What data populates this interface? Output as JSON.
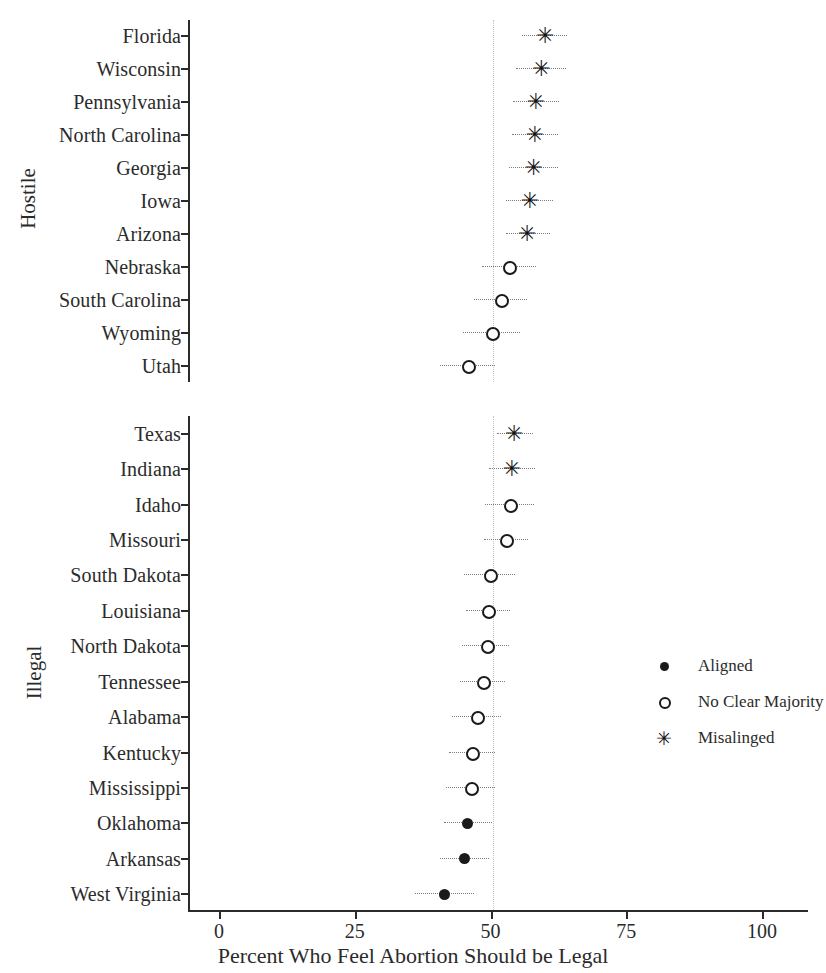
{
  "chart_data": {
    "type": "scatter",
    "title": "",
    "xlabel": "Percent Who Feel Abortion Should be Legal",
    "ylabel": "",
    "xlim": [
      0,
      100
    ],
    "xticks": [
      0,
      25,
      50,
      75,
      100
    ],
    "xtick_labels": [
      "0",
      "25",
      "50",
      "75",
      "100"
    ],
    "grid": false,
    "reference_line": 50,
    "legend_position": "right-middle",
    "orientation": "horizontal-dotplot",
    "error_bars": true,
    "panels": [
      {
        "name": "Hostile",
        "label": "Hostile",
        "categories": [
          "Florida",
          "Wisconsin",
          "Pennsylvania",
          "North Carolina",
          "Georgia",
          "Iowa",
          "Arizona",
          "Nebraska",
          "South Carolina",
          "Wyoming",
          "Utah"
        ],
        "values": [
          59.7,
          59.0,
          58.0,
          57.8,
          57.6,
          56.9,
          56.4,
          53.0,
          51.5,
          49.9,
          45.5
        ],
        "ci_low": [
          55.4,
          54.3,
          53.8,
          53.6,
          53.0,
          52.5,
          52.4,
          48.0,
          46.6,
          44.6,
          40.3
        ],
        "ci_high": [
          63.8,
          63.6,
          62.3,
          62.0,
          62.0,
          61.2,
          60.6,
          58.0,
          56.3,
          55.1,
          50.5
        ],
        "groups": [
          "Misalinged",
          "Misalinged",
          "Misalinged",
          "Misalinged",
          "Misalinged",
          "Misalinged",
          "Misalinged",
          "No Clear Majority",
          "No Clear Majority",
          "No Clear Majority",
          "No Clear Majority"
        ]
      },
      {
        "name": "Illegal",
        "label": "Illegal",
        "categories": [
          "Texas",
          "Indiana",
          "Idaho",
          "Missouri",
          "South Dakota",
          "Louisiana",
          "North Dakota",
          "Tennessee",
          "Alabama",
          "Kentucky",
          "Mississippi",
          "Oklahoma",
          "Arkansas",
          "West Virginia"
        ],
        "values": [
          54.0,
          53.6,
          53.2,
          52.5,
          49.5,
          49.1,
          48.9,
          48.2,
          47.1,
          46.2,
          46.0,
          45.4,
          44.9,
          41.1
        ],
        "ci_low": [
          50.8,
          49.4,
          48.7,
          48.4,
          44.7,
          45.1,
          44.4,
          44.1,
          42.5,
          41.9,
          41.4,
          41.0,
          40.3,
          35.8
        ],
        "ci_high": [
          57.4,
          57.9,
          57.6,
          56.5,
          54.2,
          53.2,
          53.1,
          52.3,
          51.6,
          50.4,
          50.5,
          50.0,
          49.4,
          46.6
        ],
        "groups": [
          "Misalinged",
          "Misalinged",
          "No Clear Majority",
          "No Clear Majority",
          "No Clear Majority",
          "No Clear Majority",
          "No Clear Majority",
          "No Clear Majority",
          "No Clear Majority",
          "No Clear Majority",
          "No Clear Majority",
          "Aligned",
          "Aligned",
          "Aligned"
        ]
      }
    ],
    "legend": [
      {
        "key": "aligned",
        "glyph": "filled-circle",
        "label": "Aligned"
      },
      {
        "key": "nomajority",
        "glyph": "open-circle",
        "label": "No Clear Majority"
      },
      {
        "key": "misaligned",
        "glyph": "asterisk",
        "label": "Misalinged"
      }
    ],
    "colors": {
      "marker": "#1a1a1a",
      "axis": "#2b2b2b",
      "errorbar": "#7d7d7d",
      "refline": "#c4c4c4",
      "background": "#ffffff"
    }
  }
}
